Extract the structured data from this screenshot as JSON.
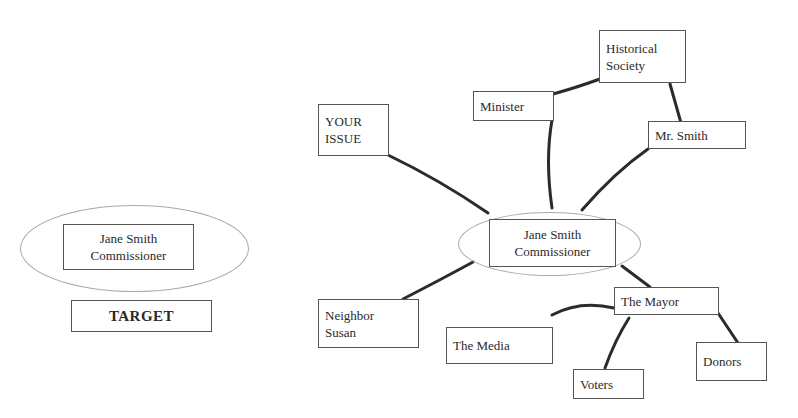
{
  "legend": {
    "target_node": {
      "line1": "Jane Smith",
      "line2": "Commissioner"
    },
    "target_label": "TARGET"
  },
  "map": {
    "center": {
      "line1": "Jane Smith",
      "line2": "Commissioner"
    },
    "nodes": {
      "your_issue": {
        "line1": "YOUR",
        "line2": "ISSUE"
      },
      "minister": {
        "label": "Minister"
      },
      "historical_society": {
        "line1": "Historical",
        "line2": "Society"
      },
      "mr_smith": {
        "label": "Mr. Smith"
      },
      "neighbor_susan": {
        "line1": "Neighbor",
        "line2": "Susan"
      },
      "the_mayor": {
        "label": "The Mayor"
      },
      "the_media": {
        "label": "The Media"
      },
      "voters": {
        "label": "Voters"
      },
      "donors": {
        "label": "Donors"
      }
    },
    "links": [
      [
        "YOUR ISSUE",
        "Jane Smith Commissioner"
      ],
      [
        "Minister",
        "Jane Smith Commissioner"
      ],
      [
        "Minister",
        "Historical Society"
      ],
      [
        "Historical Society",
        "Mr. Smith"
      ],
      [
        "Mr. Smith",
        "Jane Smith Commissioner"
      ],
      [
        "Neighbor Susan",
        "Jane Smith Commissioner"
      ],
      [
        "Jane Smith Commissioner",
        "The Mayor"
      ],
      [
        "The Mayor",
        "The Media"
      ],
      [
        "The Mayor",
        "Voters"
      ],
      [
        "The Mayor",
        "Donors"
      ]
    ],
    "colors": {
      "line": "#2b2b2b",
      "box_border": "#555555",
      "ellipse_border": "#aaaaaa"
    }
  }
}
